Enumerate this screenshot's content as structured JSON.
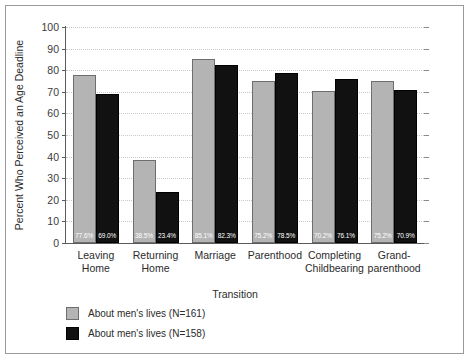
{
  "chart_data": {
    "type": "bar",
    "title": "",
    "xlabel": "Transition",
    "ylabel": "Percent Who Perceived an Age Deadline",
    "ylim": [
      0,
      100
    ],
    "ytick_step": 10,
    "yticks": [
      0,
      10,
      20,
      30,
      40,
      50,
      60,
      70,
      80,
      90,
      100
    ],
    "grid": true,
    "legend_position": "below-left",
    "categories": [
      "Leaving\nHome",
      "Returning\nHome",
      "Marriage",
      "Parenthood",
      "Completing\nChildbearing",
      "Grand-\nparenthood"
    ],
    "series": [
      {
        "name": "About men's lives (N=161)",
        "color": "#b4b4b4",
        "values": [
          77.6,
          38.5,
          85.1,
          75.2,
          70.2,
          75.2
        ],
        "labels": [
          "77.6%",
          "38.5%",
          "85.1%",
          "75.2%",
          "70.2%",
          "75.2%"
        ]
      },
      {
        "name": "About men's lives (N=158)",
        "color": "#111111",
        "values": [
          69.0,
          23.4,
          82.3,
          78.5,
          76.1,
          70.9
        ],
        "labels": [
          "69.0%",
          "23.4%",
          "82.3%",
          "78.5%",
          "76.1%",
          "70.9%"
        ]
      }
    ]
  },
  "colors": {
    "series_light": "#b4b4b4",
    "series_dark": "#111111",
    "grid": "#c9c9c9",
    "axis": "#5a5a5a",
    "frame": "#9a9a9a",
    "text": "#2b2b2b"
  }
}
